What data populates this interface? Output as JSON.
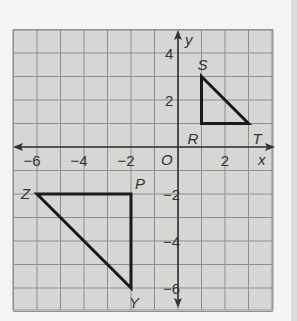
{
  "graph": {
    "x_axis_label": "x",
    "y_axis_label": "y",
    "origin_label": "O",
    "x_ticks": [
      {
        "value": -6,
        "label": "−6"
      },
      {
        "value": -4,
        "label": "−4"
      },
      {
        "value": -2,
        "label": "−2"
      },
      {
        "value": 2,
        "label": "2"
      }
    ],
    "y_ticks": [
      {
        "value": 4,
        "label": "4"
      },
      {
        "value": 2,
        "label": "2"
      },
      {
        "value": -2,
        "label": "−2"
      },
      {
        "value": -4,
        "label": "−4"
      },
      {
        "value": -6,
        "label": "−6"
      }
    ],
    "x_range": [
      -7,
      4
    ],
    "y_range": [
      -7,
      5
    ],
    "grid_color": "#8a8a8a",
    "background_color": "#d6d6d4"
  },
  "triangles": [
    {
      "name": "RST",
      "vertices": [
        {
          "label": "R",
          "x": 1,
          "y": 1
        },
        {
          "label": "S",
          "x": 1,
          "y": 3
        },
        {
          "label": "T",
          "x": 3,
          "y": 1
        }
      ]
    },
    {
      "name": "ZPY",
      "vertices": [
        {
          "label": "Z",
          "x": -6,
          "y": -2
        },
        {
          "label": "P",
          "x": -2,
          "y": -2
        },
        {
          "label": "Y",
          "x": -2,
          "y": -6
        }
      ]
    }
  ]
}
